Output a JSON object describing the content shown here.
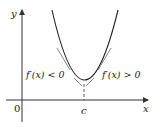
{
  "diagram": {
    "axis_labels": {
      "x": "x",
      "y": "y",
      "origin": "0"
    },
    "point_label": "c",
    "left_annotation": "f′(x) < 0",
    "right_annotation": "f′(x) > 0",
    "colors": {
      "curve": "#222222",
      "axes": "#333333",
      "tangent": "#555555"
    }
  }
}
